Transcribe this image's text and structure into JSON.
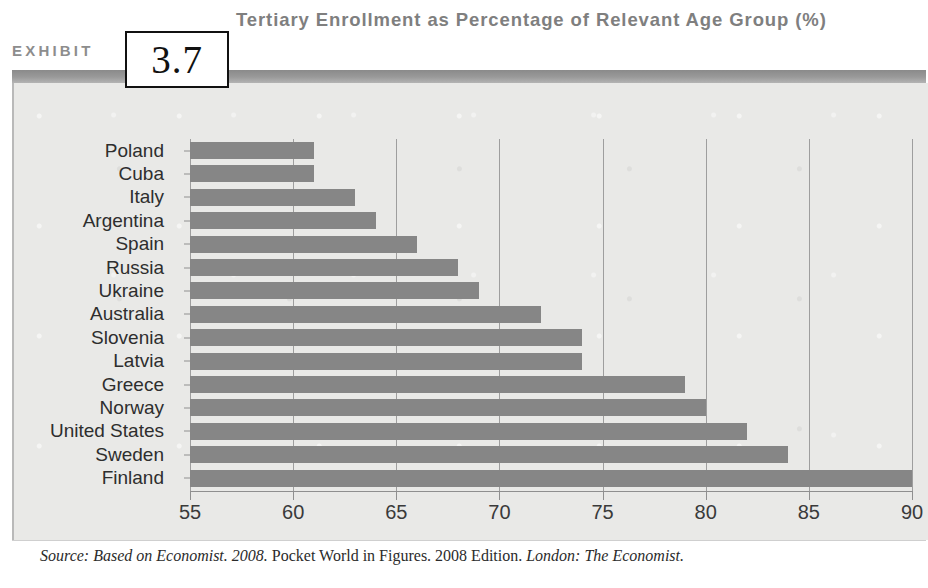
{
  "exhibit": {
    "label": "EXHIBIT",
    "number": "3.7"
  },
  "header": {
    "title": "Tertiary Enrollment as Percentage of Relevant Age Group (%)"
  },
  "source": {
    "prefix": "Source: Based on Economist. 2008.",
    "middle": " Pocket World in Figures. 2008 Edition. ",
    "suffix": "London: The Economist."
  },
  "colors": {
    "bar": "#868686",
    "panel_background": "#e9e9e7",
    "band": "#9a9a9a",
    "gridline": "#9e9e9e",
    "title_text": "#7f7f7f",
    "label_text": "#2e2e2e"
  },
  "chart_data": {
    "type": "bar",
    "orientation": "horizontal",
    "title": "Tertiary Enrollment as Percentage of Relevant Age Group (%)",
    "xlabel": "",
    "ylabel": "",
    "xlim": [
      55,
      90
    ],
    "xticks": [
      55,
      60,
      65,
      70,
      75,
      80,
      85,
      90
    ],
    "grid": true,
    "legend": false,
    "categories": [
      "Poland",
      "Cuba",
      "Italy",
      "Argentina",
      "Spain",
      "Russia",
      "Ukraine",
      "Australia",
      "Slovenia",
      "Latvia",
      "Greece",
      "Norway",
      "United States",
      "Sweden",
      "Finland"
    ],
    "values": [
      61,
      61,
      63,
      64,
      66,
      68,
      69,
      72,
      74,
      74,
      79,
      80,
      82,
      84,
      90
    ]
  }
}
